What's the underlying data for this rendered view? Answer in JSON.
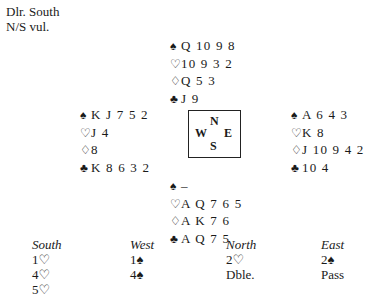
{
  "deal_info": {
    "dealer": "Dlr. South",
    "vulnerability": "N/S vul."
  },
  "icons": {
    "spades": "♠",
    "hearts": "♡",
    "diamonds": "♢",
    "clubs": "♣"
  },
  "hands": {
    "north": {
      "spades": "Q 10 9 8",
      "hearts": "10 9 3 2",
      "diamonds": "Q 5 3",
      "clubs": "J 9"
    },
    "west": {
      "spades": "K J 7 5 2",
      "hearts": "J 4",
      "diamonds": "8",
      "clubs": "K 8 6 3 2"
    },
    "east": {
      "spades": "A 6 4 3",
      "hearts": "K 8",
      "diamonds": "J 10 9 4 2",
      "clubs": "10 4"
    },
    "south": {
      "spades": "–",
      "hearts": "A Q 7 6 5",
      "diamonds": "A K 7 6",
      "clubs": "A Q 7 5"
    }
  },
  "compass": {
    "n": "N",
    "w": "W",
    "e": "E",
    "s": "S"
  },
  "auction": {
    "headers": {
      "south": "South",
      "west": "West",
      "north": "North",
      "east": "East"
    },
    "south": [
      "1♡",
      "4♡",
      "5♡"
    ],
    "west": [
      "1♠",
      "4♠"
    ],
    "north": [
      "2♡",
      "Dble."
    ],
    "east": [
      "2♠",
      "Pass"
    ]
  }
}
